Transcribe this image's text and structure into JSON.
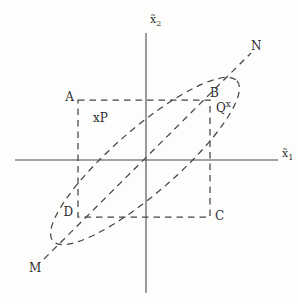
{
  "figure": {
    "background": "#fdfdfb",
    "line_color": "#454545",
    "text_color": "#2e2e2e",
    "labels": {
      "A": "A",
      "B": "B",
      "C": "C",
      "D": "D",
      "M": "M",
      "N": "N",
      "P": "xP",
      "Q_base": "Q",
      "Q_sup": "x",
      "x_axis_base": "x̃",
      "x_axis_sub": "1",
      "y_axis_base": "x̃",
      "y_axis_sub": "2"
    }
  }
}
